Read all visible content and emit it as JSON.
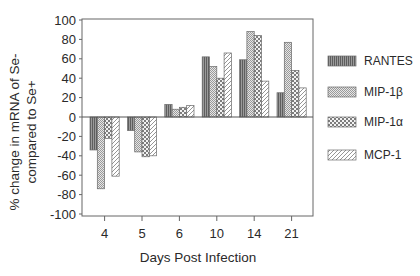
{
  "chart_data": {
    "type": "bar",
    "title": "",
    "xlabel": "Days Post Infection",
    "ylabel": [
      "% change in mRNA of Se-",
      "compared to Se+"
    ],
    "ylim": [
      -100,
      100
    ],
    "yticks": [
      100,
      80,
      60,
      40,
      20,
      0,
      -20,
      -40,
      -60,
      -80,
      -100
    ],
    "grid": false,
    "legend_position": "right",
    "categories": [
      "4",
      "5",
      "6",
      "10",
      "14",
      "21"
    ],
    "series": [
      {
        "name": "RANTES",
        "pattern": "vertical-lines-dark",
        "values": [
          -34,
          -14,
          13,
          62,
          59,
          25
        ]
      },
      {
        "name": "MIP-1β",
        "pattern": "fine-dots",
        "values": [
          -74,
          -36,
          8,
          52,
          88,
          77
        ]
      },
      {
        "name": "MIP-1α",
        "pattern": "crosshatch",
        "values": [
          -22,
          -41,
          10,
          40,
          84,
          48
        ]
      },
      {
        "name": "MCP-1",
        "pattern": "diagonal-stripes",
        "values": [
          -61,
          -40,
          12,
          66,
          37,
          30
        ]
      }
    ]
  },
  "colors": {
    "axis": "#555555",
    "text": "#2a2a2a",
    "rantes_fill": "#7a7a7a",
    "pattern_ink": "#8a8a8a"
  }
}
